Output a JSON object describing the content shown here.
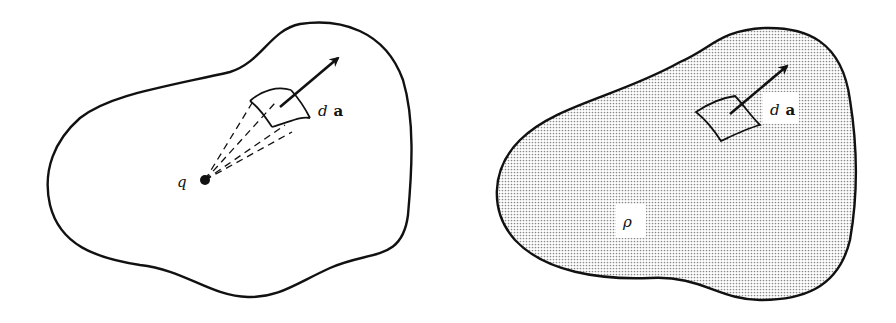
{
  "figure": {
    "left_panel": {
      "charge_label": "q",
      "area_label_d": "d",
      "area_label_a": "a",
      "description": "Point charge q inside closed surface with cone subtending area element da"
    },
    "right_panel": {
      "density_label": "ρ",
      "area_label_d": "d",
      "area_label_a": "a",
      "description": "Charge distribution ρ inside closed surface with area element da"
    },
    "colors": {
      "ink": "#111111",
      "background": "#ffffff",
      "stipple": "#9a9a9a"
    }
  }
}
